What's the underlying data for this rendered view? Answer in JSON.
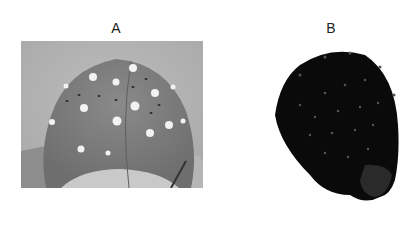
{
  "figure": {
    "panels": [
      {
        "label": "A",
        "description": "Photograph of EEG electrode cap worn on a head"
      },
      {
        "label": "B",
        "description": "3D scan reconstruction of head with EEG cap"
      }
    ]
  }
}
